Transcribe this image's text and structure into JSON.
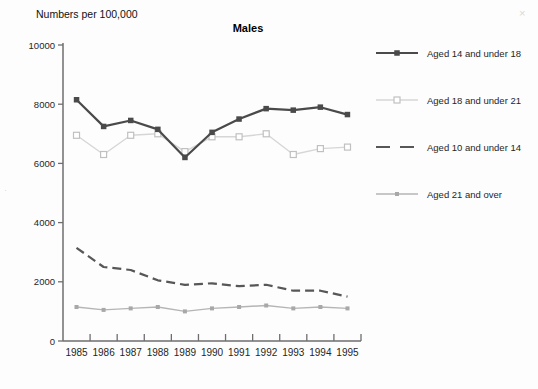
{
  "chart_data": {
    "type": "line",
    "title": "Males",
    "ylabel": "Numbers per 100,000",
    "xlabel": "",
    "x": [
      1985,
      1986,
      1987,
      1988,
      1989,
      1990,
      1991,
      1992,
      1993,
      1994,
      1995
    ],
    "ylim": [
      0,
      10000
    ],
    "yticks": [
      0,
      2000,
      4000,
      6000,
      8000,
      10000
    ],
    "grid": false,
    "legend_position": "right",
    "axis_color": "#6e6e6e",
    "series": [
      {
        "name": "Aged 14 and under 18",
        "color": "#4a4a4a",
        "line_style": "solid",
        "marker": "filled-square",
        "values": [
          8150,
          7250,
          7450,
          7150,
          6200,
          7050,
          7500,
          7850,
          7800,
          7900,
          7650
        ]
      },
      {
        "name": "Aged 18 and under 21",
        "color": "#d6d6d6",
        "marker_stroke": "#c0c0c0",
        "marker_fill": "#ffffff",
        "line_style": "solid",
        "marker": "open-square",
        "values": [
          6950,
          6300,
          6950,
          7000,
          6400,
          6900,
          6900,
          7000,
          6300,
          6500,
          6550
        ]
      },
      {
        "name": "Aged 10 and under 14",
        "color": "#575757",
        "line_style": "dashed",
        "marker": "none",
        "values": [
          3150,
          2500,
          2400,
          2050,
          1900,
          1950,
          1850,
          1900,
          1700,
          1700,
          1500
        ]
      },
      {
        "name": "Aged 21 and over",
        "color": "#b5b5b5",
        "marker_fill": "#a8a8a8",
        "line_style": "solid",
        "marker": "small-filled-square",
        "values": [
          1150,
          1050,
          1100,
          1150,
          1000,
          1100,
          1150,
          1200,
          1100,
          1150,
          1100
        ]
      }
    ]
  },
  "artifacts": [
    "×",
    "·"
  ]
}
